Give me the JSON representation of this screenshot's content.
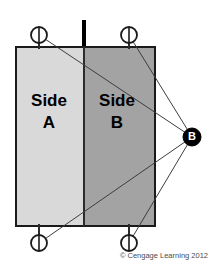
{
  "figure": {
    "panels": [
      {
        "id": "side-a",
        "label_line1": "Side",
        "label_line2": "A",
        "fill": "#d9d9d9",
        "x": 16,
        "y": 47,
        "width": 68,
        "height": 179
      },
      {
        "id": "side-b",
        "label_line1": "Side",
        "label_line2": "B",
        "fill": "#a3a3a3",
        "x": 84,
        "y": 47,
        "width": 71,
        "height": 179
      }
    ],
    "point_b": {
      "label": "B",
      "cx": 192,
      "cy": 137,
      "r": 9,
      "fill": "#000000",
      "text_color": "#ffffff"
    },
    "bolts": [
      {
        "id": "bolt-top-left",
        "cx": 39,
        "cy": 35,
        "r": 8,
        "stem_y1": 35,
        "stem_y2": 49
      },
      {
        "id": "bolt-top-right",
        "cx": 129,
        "cy": 35,
        "r": 8,
        "stem_y1": 35,
        "stem_y2": 49
      },
      {
        "id": "bolt-bottom-left",
        "cx": 39,
        "cy": 243,
        "r": 8,
        "stem_y1": 224,
        "stem_y2": 243
      },
      {
        "id": "bolt-bottom-right",
        "cx": 129,
        "cy": 243,
        "r": 8,
        "stem_y1": 224,
        "stem_y2": 243
      }
    ],
    "hinge_post": {
      "id": "hinge-post",
      "x": 84,
      "y1": 20,
      "y2": 48,
      "width": 4,
      "color": "#000000"
    },
    "sight_lines": [
      {
        "id": "sight-line-top-left",
        "x1": 39,
        "y1": 35,
        "x2": 192,
        "y2": 137
      },
      {
        "id": "sight-line-top-right",
        "x1": 129,
        "y1": 35,
        "x2": 192,
        "y2": 137
      },
      {
        "id": "sight-line-bottom-left",
        "x1": 39,
        "y1": 243,
        "x2": 192,
        "y2": 137
      },
      {
        "id": "sight-line-bottom-right",
        "x1": 129,
        "y1": 243,
        "x2": 192,
        "y2": 137
      }
    ],
    "outline_color": "#1a1a1a",
    "line_color": "#3d3d3d"
  },
  "credit": {
    "text": "© Cengage Learning 2012",
    "x": 208,
    "y": 258
  }
}
